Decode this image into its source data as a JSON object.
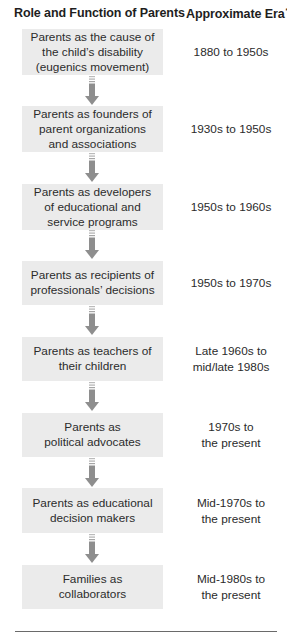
{
  "header": {
    "role_label": "Role and Function of Parents",
    "era_label": "Approximate Era",
    "era_footnote_mark": "*"
  },
  "colors": {
    "box_fill": "#ebebeb",
    "arrow": "#8e8e8e",
    "text": "#2b2b2b"
  },
  "rows": [
    {
      "role": "Parents as the cause of\nthe child’s disability\n(eugenics movement)",
      "era": "1880 to 1950s"
    },
    {
      "role": "Parents as founders of\nparent organizations\nand associations",
      "era": "1930s to 1950s"
    },
    {
      "role": "Parents as developers\nof educational and\nservice programs",
      "era": "1950s to 1960s"
    },
    {
      "role": "Parents as recipients of\nprofessionals’ decisions",
      "era": "1950s to 1970s"
    },
    {
      "role": "Parents as teachers of\ntheir children",
      "era": "Late 1960s to\nmid/late 1980s"
    },
    {
      "role": "Parents as\npolitical advocates",
      "era": "1970s to\nthe present"
    },
    {
      "role": "Parents as educational\ndecision makers",
      "era": "Mid-1970s to\nthe present"
    },
    {
      "role": "Families as\ncollaborators",
      "era": "Mid-1980s to\nthe present"
    }
  ],
  "arrows": [
    {
      "from": 1,
      "to": 2,
      "icon": "down-arrow-icon"
    },
    {
      "from": 2,
      "to": 3,
      "icon": "down-arrow-icon"
    },
    {
      "from": 3,
      "to": 4,
      "icon": "down-arrow-icon"
    },
    {
      "from": 4,
      "to": 5,
      "icon": "down-arrow-icon"
    },
    {
      "from": 5,
      "to": 6,
      "icon": "down-arrow-icon"
    },
    {
      "from": 6,
      "to": 7,
      "icon": "down-arrow-icon"
    },
    {
      "from": 7,
      "to": 8,
      "icon": "down-arrow-icon"
    }
  ]
}
